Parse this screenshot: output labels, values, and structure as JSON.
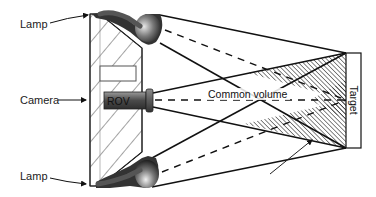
{
  "diagram": {
    "labels": {
      "lamp_top": "Lamp",
      "camera": "Camera",
      "lamp_bottom": "Lamp",
      "rov": "ROV",
      "common_volume": "Common volume",
      "target": "Target"
    },
    "colors": {
      "line": "#111111",
      "hatch": "#222222",
      "background": "#ffffff",
      "rov_body_dark": "#3a3a3a",
      "rov_body_light": "#8a8a8a",
      "lamp_dark": "#2a2a2a",
      "lamp_light": "#dcdcdc"
    },
    "components": [
      "ROV hull (hatched window)",
      "top lamp",
      "bottom lamp",
      "camera",
      "target plate",
      "light cones",
      "camera field of view",
      "common volume (hatched)",
      "annotation pointer"
    ]
  }
}
